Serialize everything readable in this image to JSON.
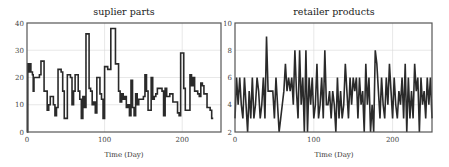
{
  "chart_data": [
    {
      "type": "line",
      "title": "suplier parts",
      "xlabel": "Time (Day)",
      "ylabel": "",
      "xlim": [
        0,
        250
      ],
      "ylim": [
        0,
        40
      ],
      "xticks": [
        0,
        100,
        200
      ],
      "yticks": [
        0,
        10,
        20,
        30,
        40
      ],
      "grid": true,
      "legend": null,
      "series": [
        {
          "name": "suplier parts",
          "step": true,
          "x": [
            0,
            1,
            2,
            3,
            4,
            5,
            6,
            7,
            8,
            9,
            10,
            12,
            14,
            16,
            18,
            20,
            22,
            24,
            26,
            28,
            30,
            32,
            34,
            36,
            38,
            40,
            42,
            44,
            46,
            48,
            50,
            52,
            54,
            56,
            58,
            60,
            62,
            64,
            66,
            68,
            70,
            72,
            74,
            76,
            78,
            80,
            82,
            84,
            86,
            88,
            90,
            92,
            94,
            96,
            98,
            100,
            102,
            104,
            106,
            108,
            110,
            112,
            114,
            116,
            118,
            120,
            122,
            124,
            126,
            128,
            130,
            132,
            134,
            136,
            138,
            140,
            142,
            144,
            146,
            148,
            150,
            152,
            154,
            156,
            158,
            160,
            162,
            164,
            166,
            168,
            170,
            172,
            174,
            176,
            178,
            180,
            182,
            184,
            186,
            188,
            190,
            192,
            194,
            196,
            198,
            200,
            202,
            204,
            206,
            208,
            210,
            212,
            214,
            216,
            218,
            220,
            222,
            224,
            226,
            228,
            230,
            232,
            234,
            236,
            238,
            240,
            242,
            244,
            246,
            248,
            250
          ],
          "values": [
            0,
            25,
            23,
            22,
            25,
            22,
            22,
            21,
            15,
            20,
            20,
            20,
            20,
            21,
            26,
            26,
            15,
            15,
            8,
            10,
            13,
            13,
            10,
            6,
            9,
            23,
            23,
            22,
            15,
            5,
            5,
            21,
            21,
            20,
            10,
            15,
            21,
            21,
            15,
            12,
            5,
            13,
            9,
            36,
            36,
            16,
            15,
            10,
            11,
            7,
            20,
            20,
            14,
            12,
            5,
            24,
            24,
            23,
            23,
            38,
            38,
            38,
            25,
            25,
            15,
            11,
            14,
            12,
            13,
            9,
            10,
            6,
            19,
            9,
            6,
            14,
            10,
            12,
            12,
            12,
            13,
            21,
            15,
            8,
            8,
            20,
            12,
            13,
            14,
            16,
            16,
            16,
            15,
            6,
            16,
            13,
            13,
            14,
            14,
            11,
            11,
            11,
            7,
            6,
            29,
            29,
            16,
            8,
            8,
            8,
            21,
            17,
            20,
            15,
            15,
            14,
            13,
            18,
            17,
            14,
            14,
            9,
            9,
            8,
            5
          ]
        }
      ]
    },
    {
      "type": "line",
      "title": "retailer products",
      "xlabel": "Time (Day)",
      "ylabel": "",
      "xlim": [
        0,
        250
      ],
      "ylim": [
        2,
        10
      ],
      "xticks": [
        0,
        100,
        200
      ],
      "yticks": [
        2,
        4,
        6,
        8,
        10
      ],
      "grid": true,
      "legend": null,
      "series": [
        {
          "name": "retailer products",
          "step": false,
          "x": [
            0,
            2,
            4,
            6,
            8,
            10,
            12,
            14,
            16,
            18,
            20,
            22,
            24,
            26,
            28,
            30,
            32,
            34,
            36,
            38,
            40,
            42,
            44,
            46,
            48,
            50,
            52,
            54,
            56,
            58,
            60,
            62,
            64,
            66,
            68,
            70,
            72,
            74,
            76,
            78,
            80,
            82,
            84,
            86,
            88,
            90,
            92,
            94,
            96,
            98,
            100,
            102,
            104,
            106,
            108,
            110,
            112,
            114,
            116,
            118,
            120,
            122,
            124,
            126,
            128,
            130,
            132,
            134,
            136,
            138,
            140,
            142,
            144,
            146,
            148,
            150,
            152,
            154,
            156,
            158,
            160,
            162,
            164,
            166,
            168,
            170,
            172,
            174,
            176,
            178,
            180,
            182,
            184,
            186,
            188,
            190,
            192,
            194,
            196,
            198,
            200,
            202,
            204,
            206,
            208,
            210,
            212,
            214,
            216,
            218,
            220,
            222,
            224,
            226,
            228,
            230,
            232,
            234,
            236,
            238,
            240,
            242,
            244,
            246,
            248,
            250
          ],
          "values": [
            3,
            6,
            4,
            6,
            4,
            3,
            6,
            4,
            2,
            5,
            3,
            6,
            3,
            4,
            6,
            5,
            3,
            4,
            6,
            3,
            9,
            5,
            5,
            5,
            5,
            3,
            6,
            4,
            2,
            3,
            4,
            5,
            7,
            5,
            6,
            5,
            6,
            4,
            8,
            5,
            3,
            8,
            4,
            6,
            2,
            8,
            2,
            6,
            4,
            6,
            3,
            4,
            7,
            3,
            4,
            6,
            3,
            8,
            4,
            4,
            5,
            3,
            5,
            4,
            2,
            6,
            3,
            5,
            3,
            4,
            7,
            5,
            3,
            6,
            4,
            6,
            5,
            6,
            3,
            6,
            4,
            5,
            2,
            7,
            4,
            6,
            2,
            4,
            2,
            8,
            7,
            5,
            3,
            6,
            4,
            3,
            6,
            4,
            7,
            5,
            3,
            6,
            4,
            3,
            5,
            4,
            6,
            3,
            7,
            2,
            6,
            3,
            5,
            3,
            7,
            5,
            6,
            2,
            6,
            4,
            5,
            3,
            6,
            4,
            6,
            3
          ]
        }
      ]
    }
  ]
}
